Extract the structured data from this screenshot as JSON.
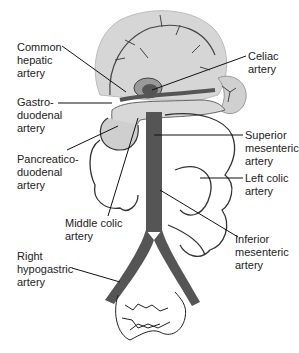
{
  "diagram": {
    "colors": {
      "aorta": "#555555",
      "organ_fill": "#d6d6d6",
      "organ_dark": "#9a9a9a",
      "vessel_line": "#333333",
      "leader_line": "#111111",
      "background": "#ffffff"
    },
    "labels": [
      {
        "id": "common-hepatic",
        "text": "Common\nhepatic\nartery"
      },
      {
        "id": "celiac",
        "text": "Celiac\nartery"
      },
      {
        "id": "gastroduodenal",
        "text": "Gastro-\nduodenal\nartery"
      },
      {
        "id": "pancreaticoduodenal",
        "text": "Pancreatico-\nduodenal\nartery"
      },
      {
        "id": "superior-mesenteric",
        "text": "Superior\nmesenteric\nartery"
      },
      {
        "id": "left-colic",
        "text": "Left colic\nartery"
      },
      {
        "id": "middle-colic",
        "text": "Middle colic\nartery"
      },
      {
        "id": "inferior-mesenteric",
        "text": "Inferior\nmesenteric\nartery"
      },
      {
        "id": "right-hypogastric",
        "text": "Right\nhypogastric\nartery"
      }
    ]
  }
}
